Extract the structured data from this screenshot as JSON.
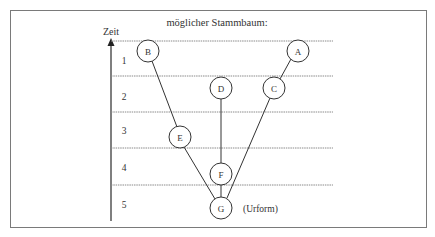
{
  "diagram": {
    "title": "möglicher Stammbaum:",
    "axis": {
      "label": "Zeit",
      "ticks": [
        "1",
        "2",
        "3",
        "4",
        "5"
      ]
    },
    "nodes": [
      {
        "id": "B",
        "label": "B",
        "x": 148,
        "y": 51
      },
      {
        "id": "A",
        "label": "A",
        "x": 298,
        "y": 51
      },
      {
        "id": "D",
        "label": "D",
        "x": 221,
        "y": 88
      },
      {
        "id": "C",
        "label": "C",
        "x": 274,
        "y": 88
      },
      {
        "id": "E",
        "label": "E",
        "x": 180,
        "y": 137
      },
      {
        "id": "F",
        "label": "F",
        "x": 221,
        "y": 174
      },
      {
        "id": "G",
        "label": "G",
        "x": 221,
        "y": 208
      }
    ],
    "edges": [
      [
        "B",
        "E"
      ],
      [
        "E",
        "G"
      ],
      [
        "D",
        "F"
      ],
      [
        "F",
        "G"
      ],
      [
        "A",
        "C"
      ],
      [
        "C",
        "G"
      ]
    ],
    "annotation": "(Urform)"
  }
}
